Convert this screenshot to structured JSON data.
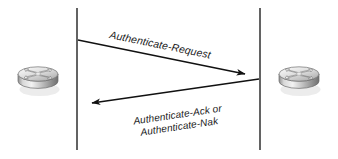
{
  "diagram": {
    "type": "network-message-sequence",
    "background_color": "#ffffff",
    "line_color": "#3c3c3c",
    "arrow_color": "#111111",
    "text_color": "#1a1a1a",
    "nodes": [
      {
        "id": "left-router",
        "name": "router-left",
        "icon": "router-icon",
        "label": "",
        "x": 38,
        "y": 76
      },
      {
        "id": "right-router",
        "name": "router-right",
        "icon": "router-icon",
        "label": "",
        "x": 299,
        "y": 76
      }
    ],
    "lifelines": [
      {
        "id": "left-lifeline",
        "x": 77,
        "y_top": 8,
        "y_bottom": 150
      },
      {
        "id": "right-lifeline",
        "x": 260,
        "y_top": 8,
        "y_bottom": 150
      }
    ],
    "messages": [
      {
        "id": "msg-request",
        "label": "Authenticate-Request",
        "direction": "left-to-right",
        "from_x": 78,
        "from_y": 40,
        "to_x": 245,
        "to_y": 74,
        "label_rotation": 11.5
      },
      {
        "id": "msg-reply",
        "label_line_1": "Authenticate-Ack or",
        "label_line_2": "Authenticate-Nak",
        "direction": "right-to-left",
        "from_x": 259,
        "from_y": 79,
        "to_x": 88,
        "to_y": 104,
        "label_rotation": -8.5
      }
    ]
  }
}
